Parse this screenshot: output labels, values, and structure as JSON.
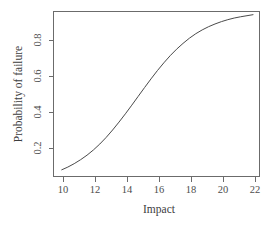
{
  "chart_data": {
    "type": "line",
    "title": "",
    "xlabel": "Impact",
    "ylabel": "Probability of failure",
    "xlim": [
      9.9,
      21.9
    ],
    "ylim": [
      0.075,
      0.94
    ],
    "xticks": [
      10,
      12,
      14,
      16,
      18,
      20,
      22
    ],
    "xtick_labels": [
      "10",
      "12",
      "14",
      "16",
      "18",
      "20",
      "22"
    ],
    "yticks": [
      0.2,
      0.4,
      0.6,
      0.8
    ],
    "ytick_labels": [
      "0.2",
      "0.4",
      "0.6",
      "0.8"
    ],
    "grid": false,
    "legend": null,
    "series": [
      {
        "name": "Probability of failure",
        "color": "#4a4a4a",
        "x": [
          9.9,
          10.3,
          10.7,
          11.1,
          11.5,
          11.9,
          12.3,
          12.7,
          13.1,
          13.5,
          13.9,
          14.3,
          14.7,
          15.1,
          15.5,
          15.9,
          16.3,
          16.7,
          17.1,
          17.5,
          17.9,
          18.3,
          18.7,
          19.1,
          19.5,
          19.9,
          20.3,
          20.7,
          21.1,
          21.5,
          21.9
        ],
        "y": [
          0.078,
          0.094,
          0.113,
          0.135,
          0.16,
          0.189,
          0.222,
          0.259,
          0.3,
          0.344,
          0.39,
          0.438,
          0.487,
          0.536,
          0.584,
          0.63,
          0.673,
          0.713,
          0.749,
          0.781,
          0.81,
          0.835,
          0.856,
          0.874,
          0.889,
          0.902,
          0.913,
          0.922,
          0.929,
          0.935,
          0.941
        ]
      }
    ]
  },
  "axes": {
    "xlabel": "Impact",
    "ylabel": "Probability of failure"
  }
}
